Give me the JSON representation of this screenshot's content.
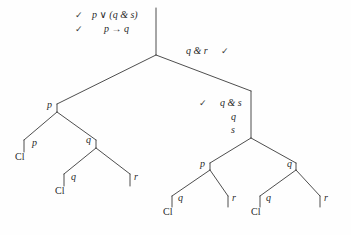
{
  "figure": {
    "kind": "logic-proof-tree",
    "background_color": "#fefefe",
    "ink_color": "#3a3a3a",
    "text_color": "#2a2a2a"
  },
  "check_glyph": "✓",
  "premises": [
    {
      "id": "premise-1",
      "check": "✓",
      "formula": "p ∨ (q & s)",
      "x": 92,
      "y": 10
    },
    {
      "id": "premise-2",
      "check": "✓",
      "formula": "p → q",
      "x": 104,
      "y": 24
    }
  ],
  "annotations": [
    {
      "id": "annotation-q-and-r",
      "formula": "q & r",
      "check": "✓",
      "check_side": "right",
      "x": 186,
      "y": 46
    },
    {
      "id": "annotation-q-and-s",
      "formula": "q & s",
      "check": "✓",
      "check_side": "left",
      "x": 220,
      "y": 98
    },
    {
      "id": "annotation-q",
      "formula": "q",
      "x": 231,
      "y": 112
    },
    {
      "id": "annotation-s",
      "formula": "s",
      "x": 231,
      "y": 125
    }
  ],
  "node_labels": [
    {
      "id": "node-left-p",
      "formula": "p",
      "x": 47,
      "y": 100
    },
    {
      "id": "node-left-q",
      "formula": "q",
      "x": 86,
      "y": 135
    },
    {
      "id": "node-right-p",
      "formula": "p",
      "x": 200,
      "y": 159
    },
    {
      "id": "node-right-q",
      "formula": "q",
      "x": 287,
      "y": 159
    },
    {
      "id": "leaf-1-p",
      "formula": "p",
      "x": 32,
      "y": 138
    },
    {
      "id": "leaf-2-q",
      "formula": "q",
      "x": 71,
      "y": 172
    },
    {
      "id": "leaf-3-r",
      "formula": "r",
      "x": 129,
      "y": 172
    },
    {
      "id": "leaf-4-q",
      "formula": "q",
      "x": 178,
      "y": 193
    },
    {
      "id": "leaf-5-r",
      "formula": "r",
      "x": 227,
      "y": 193
    },
    {
      "id": "leaf-6-q",
      "formula": "q",
      "x": 266,
      "y": 193
    },
    {
      "id": "leaf-7-r",
      "formula": "r",
      "x": 319,
      "y": 193
    }
  ],
  "closed_markers": [
    {
      "id": "closed-1",
      "label": "Cl",
      "x": 22,
      "y": 150
    },
    {
      "id": "closed-2",
      "label": "Cl",
      "x": 62,
      "y": 184
    },
    {
      "id": "closed-3",
      "label": "Cl",
      "x": 169,
      "y": 205
    },
    {
      "id": "closed-4",
      "label": "Cl",
      "x": 258,
      "y": 205
    }
  ],
  "edges": [
    {
      "id": "trunk",
      "points": "156,8 156,55"
    },
    {
      "id": "root-split-left",
      "points": "156,55 57,104"
    },
    {
      "id": "root-split-right",
      "points": "156,55 251,91"
    },
    {
      "id": "left-stem",
      "points": "57,104 57,112"
    },
    {
      "id": "left-split-left",
      "points": "57,112 24,140"
    },
    {
      "id": "left-split-right",
      "points": "57,112 96,140"
    },
    {
      "id": "leaf1-stem",
      "points": "24,140 24,152"
    },
    {
      "id": "left-q-stem",
      "points": "96,140 96,148"
    },
    {
      "id": "left-q-split-left",
      "points": "96,148 64,174"
    },
    {
      "id": "left-q-split-right",
      "points": "96,148 130,174"
    },
    {
      "id": "leaf2-stem",
      "points": "64,174 64,186"
    },
    {
      "id": "leaf3-stem",
      "points": "130,174 130,186"
    },
    {
      "id": "right-stem",
      "points": "251,91 251,138"
    },
    {
      "id": "right-split-left",
      "points": "251,138 210,163"
    },
    {
      "id": "right-split-right",
      "points": "251,138 296,163"
    },
    {
      "id": "rp-stem",
      "points": "210,163 210,170"
    },
    {
      "id": "rp-split-left",
      "points": "210,170 172,196"
    },
    {
      "id": "rp-split-right",
      "points": "210,170 228,196"
    },
    {
      "id": "leaf4-stem",
      "points": "172,196 172,207"
    },
    {
      "id": "leaf5-stem",
      "points": "228,196 228,207"
    },
    {
      "id": "rq-stem",
      "points": "296,163 296,170"
    },
    {
      "id": "rq-split-left",
      "points": "296,170 260,196"
    },
    {
      "id": "rq-split-right",
      "points": "296,170 320,196"
    },
    {
      "id": "leaf6-stem",
      "points": "260,196 260,207"
    },
    {
      "id": "leaf7-stem",
      "points": "320,196 320,207"
    }
  ]
}
